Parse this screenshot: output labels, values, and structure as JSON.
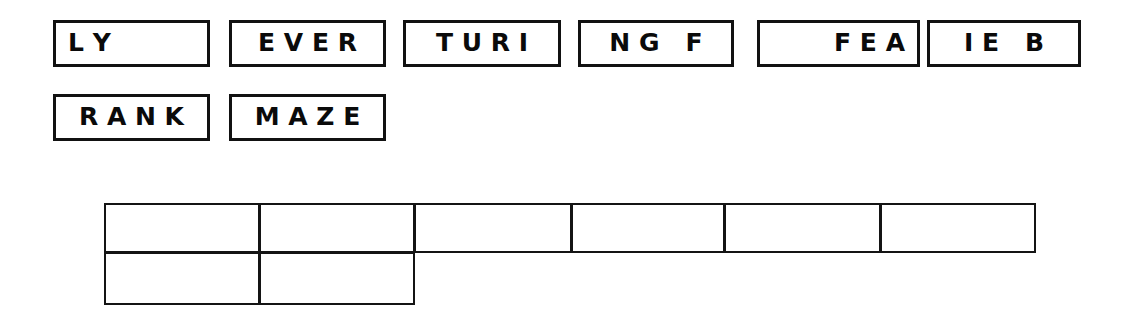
{
  "page": {
    "background_color": "#ffffff",
    "ink_color": "#111111",
    "width": 1135,
    "height": 322
  },
  "word_boxes": {
    "rows": [
      {
        "row_index": 0,
        "boxes": [
          {
            "id": "box-ly",
            "text": "L Y",
            "align": "left",
            "x": 53,
            "y": 20,
            "width": 157,
            "height": 47
          },
          {
            "id": "box-ever",
            "text": "E V E R",
            "align": "center",
            "x": 229,
            "y": 20,
            "width": 157,
            "height": 47
          },
          {
            "id": "box-turing",
            "text": "T U R I",
            "align": "center",
            "x": 403,
            "y": 20,
            "width": 158,
            "height": 47
          },
          {
            "id": "box-ngf",
            "text": "N G   F",
            "align": "center",
            "x": 578,
            "y": 20,
            "width": 156,
            "height": 47
          },
          {
            "id": "box-fea",
            "text": "F E A",
            "align": "right",
            "x": 757,
            "y": 20,
            "width": 163,
            "height": 47
          },
          {
            "id": "box-ieb",
            "text": "I E   B",
            "align": "center",
            "x": 927,
            "y": 20,
            "width": 154,
            "height": 47
          }
        ]
      },
      {
        "row_index": 1,
        "boxes": [
          {
            "id": "box-rank",
            "text": "R A N K",
            "align": "center",
            "x": 53,
            "y": 94,
            "width": 157,
            "height": 47
          },
          {
            "id": "box-maze",
            "text": "M A Z E",
            "align": "center",
            "x": 229,
            "y": 94,
            "width": 157,
            "height": 47
          }
        ]
      }
    ]
  },
  "grid": {
    "label": "segment-grid",
    "row_top": {
      "y": 203,
      "height": 50,
      "cells": [
        {
          "id": "grid-cell-r1c1",
          "x": 104,
          "width": 156
        },
        {
          "id": "grid-cell-r1c2",
          "x": 259,
          "width": 156
        },
        {
          "id": "grid-cell-r1c3",
          "x": 414,
          "width": 158
        },
        {
          "id": "grid-cell-r1c4",
          "x": 571,
          "width": 154
        },
        {
          "id": "grid-cell-r1c5",
          "x": 724,
          "width": 157
        },
        {
          "id": "grid-cell-r1c6",
          "x": 880,
          "width": 156
        }
      ]
    },
    "row_bottom": {
      "y": 252,
      "height": 53,
      "cells": [
        {
          "id": "grid-cell-r2c1",
          "x": 104,
          "width": 156
        },
        {
          "id": "grid-cell-r2c2",
          "x": 259,
          "width": 156
        }
      ]
    }
  }
}
